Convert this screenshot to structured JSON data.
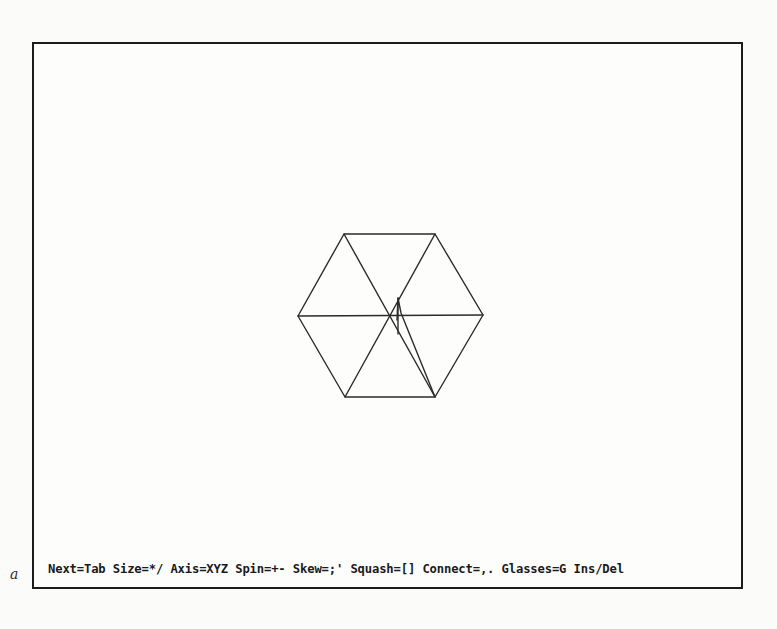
{
  "window": {
    "border_color": "#1c1c1c",
    "background": "#fdfdfc"
  },
  "viewport": {
    "object": "hexagon-wireframe",
    "stroke_color": "#2b2b2b",
    "vertices": [
      {
        "name": "top-left",
        "x": 344,
        "y": 234
      },
      {
        "name": "top-right",
        "x": 435,
        "y": 234
      },
      {
        "name": "right",
        "x": 483,
        "y": 315
      },
      {
        "name": "bottom-right",
        "x": 435,
        "y": 397
      },
      {
        "name": "bottom-left",
        "x": 345,
        "y": 397
      },
      {
        "name": "left",
        "x": 298,
        "y": 316
      }
    ],
    "center": {
      "x": 398,
      "y": 316
    },
    "axis_tick": {
      "x": 398,
      "y1": 298,
      "y2": 334
    }
  },
  "status_bar": {
    "commands": [
      {
        "label": "Next=Tab"
      },
      {
        "label": "Size=*/"
      },
      {
        "label": "Axis=XYZ"
      },
      {
        "label": "Spin=+-"
      },
      {
        "label": "Skew=;'"
      },
      {
        "label": "Squash=[]"
      },
      {
        "label": "Connect=,."
      },
      {
        "label": "Glasses=G"
      },
      {
        "label": "Ins/Del"
      }
    ]
  },
  "margin_mark": "a"
}
